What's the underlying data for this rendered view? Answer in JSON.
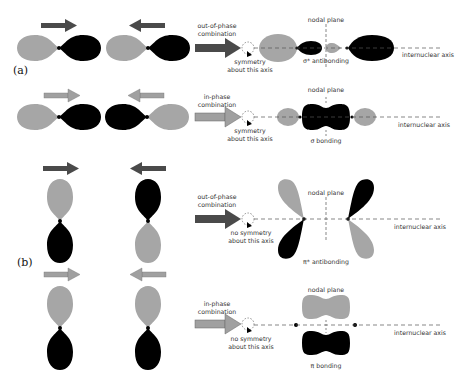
{
  "colors": {
    "positive_lobe": "#a6a6a6",
    "negative_lobe": "#000000",
    "arrow_dark": "#4a4a4a",
    "arrow_light": "#a0a0a0",
    "text": "#333333",
    "axis_dash": "#555555"
  },
  "part_a": {
    "label": "(a)",
    "row1": {
      "combination_label_1": "out-of-phase",
      "combination_label_2": "combination",
      "symmetry_label_1": "symmetry",
      "symmetry_label_2": "about this axis",
      "nodal_plane_label": "nodal plane",
      "result_label": "σ* antibonding",
      "axis_label": "internuclear axis"
    },
    "row2": {
      "combination_label_1": "in-phase",
      "combination_label_2": "combination",
      "symmetry_label_1": "symmetry",
      "symmetry_label_2": "about this axis",
      "nodal_plane_label": "nodal plane",
      "result_label": "σ bonding",
      "axis_label": "internuclear axis"
    }
  },
  "part_b": {
    "label": "(b)",
    "row1": {
      "combination_label_1": "out-of-phase",
      "combination_label_2": "combination",
      "symmetry_label_1": "no symmetry",
      "symmetry_label_2": "about this axis",
      "nodal_plane_label": "nodal plane",
      "result_label": "π* antibonding",
      "axis_label": "internuclear axis"
    },
    "row2": {
      "combination_label_1": "in-phase",
      "combination_label_2": "combination",
      "symmetry_label_1": "no symmetry",
      "symmetry_label_2": "about this axis",
      "nodal_plane_label": "nodal plane",
      "result_label": "π bonding",
      "axis_label": "internuclear axis"
    }
  }
}
